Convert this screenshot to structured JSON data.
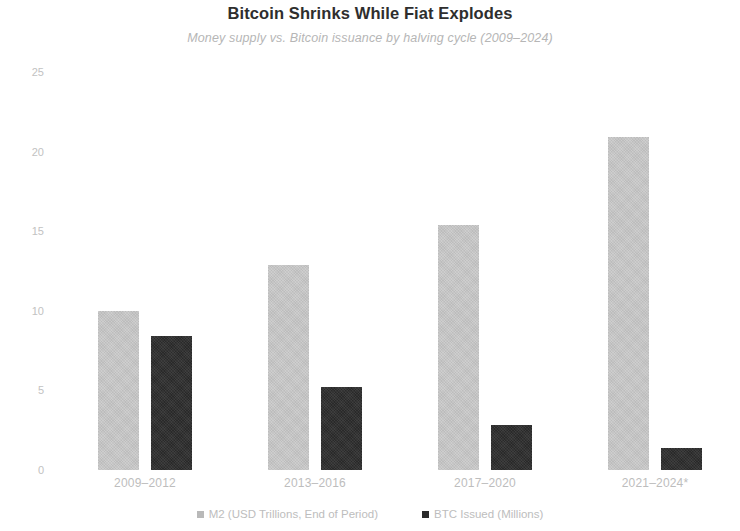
{
  "chart_data": {
    "type": "bar",
    "title": "Bitcoin Shrinks While Fiat Explodes",
    "subtitle": "Money supply vs. Bitcoin issuance by halving cycle (2009–2024)",
    "categories": [
      "2009–2012",
      "2013–2016",
      "2017–2020",
      "2021–2024*"
    ],
    "series": [
      {
        "name": "M2 (USD Trillions, End of Period)",
        "color": "#c9c9c9",
        "values": [
          10.0,
          12.9,
          15.4,
          20.9
        ]
      },
      {
        "name": "BTC Issued (Millions)",
        "color": "#2b2b2b",
        "values": [
          8.4,
          5.2,
          2.8,
          1.4
        ]
      }
    ],
    "xlabel": "",
    "ylabel": "",
    "ylim": [
      0,
      25
    ],
    "yticks": [
      "0",
      "5",
      "10",
      "15",
      "20",
      "25"
    ],
    "ytick_values": [
      0,
      5,
      10,
      15,
      20,
      25
    ],
    "grid": false,
    "legend_position": "bottom"
  }
}
